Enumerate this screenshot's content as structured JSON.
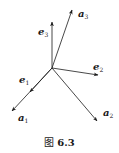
{
  "figure": {
    "caption_prefix": "图",
    "caption_number": "6.3",
    "origin": [
      52,
      68
    ],
    "line_color": "#1a1a1a",
    "vectors": [
      {
        "id": "e3",
        "symbol": "e",
        "subscript": "3",
        "tip": [
          52,
          22
        ],
        "label_pos": [
          38,
          27
        ]
      },
      {
        "id": "a3",
        "symbol": "a",
        "subscript": "3",
        "tip": [
          72,
          10
        ],
        "label_pos": [
          78,
          9
        ]
      },
      {
        "id": "e2",
        "symbol": "e",
        "subscript": "2",
        "tip": [
          98,
          75
        ],
        "label_pos": [
          93,
          62
        ]
      },
      {
        "id": "e1",
        "symbol": "e",
        "subscript": "1",
        "tip": [
          30,
          92
        ],
        "label_pos": [
          19,
          75
        ]
      },
      {
        "id": "a1",
        "symbol": "a",
        "subscript": "1",
        "tip": [
          12,
          111
        ],
        "label_pos": [
          18,
          113
        ]
      },
      {
        "id": "a2",
        "symbol": "a",
        "subscript": "2",
        "tip": [
          97,
          121
        ],
        "label_pos": [
          103,
          108
        ]
      }
    ]
  }
}
